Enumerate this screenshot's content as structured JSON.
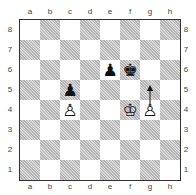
{
  "board": {
    "files": [
      "a",
      "b",
      "c",
      "d",
      "e",
      "f",
      "g",
      "h"
    ],
    "ranks": [
      "8",
      "7",
      "6",
      "5",
      "4",
      "3",
      "2",
      "1"
    ],
    "colors": {
      "light": "#ffffff",
      "dark": "#c9c9c9",
      "border": "#333333"
    }
  },
  "pieces": [
    {
      "square": "e6",
      "color": "black",
      "type": "pawn",
      "glyph": "♟"
    },
    {
      "square": "f6",
      "color": "black",
      "type": "king",
      "glyph": "♚"
    },
    {
      "square": "c5",
      "color": "black",
      "type": "pawn",
      "glyph": "♟"
    },
    {
      "square": "c4",
      "color": "white",
      "type": "pawn",
      "glyph": "♙"
    },
    {
      "square": "f4",
      "color": "white",
      "type": "king",
      "glyph": "♔"
    },
    {
      "square": "g4",
      "color": "white",
      "type": "pawn",
      "glyph": "♙"
    }
  ],
  "arrows": [
    {
      "from": "g4",
      "to": "g5",
      "label": "g4-g5 move arrow"
    }
  ]
}
